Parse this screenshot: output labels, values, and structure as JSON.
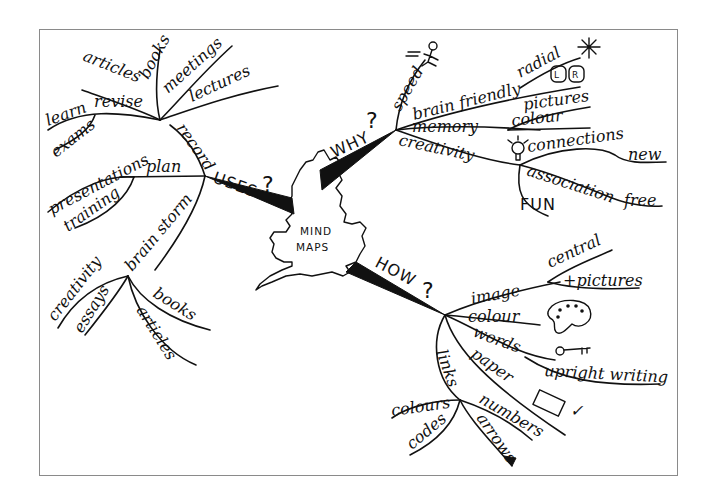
{
  "diagram": {
    "type": "mind-map",
    "center": {
      "line1": "MIND",
      "line2": "MAPS",
      "shape": "great-britain-outline"
    },
    "branches": {
      "uses": {
        "label": "USES",
        "marker": "?",
        "children": {
          "record": {
            "label": "record",
            "children": [
              "articles",
              "books",
              "meetings",
              "lectures"
            ]
          },
          "revise": {
            "label": "revise",
            "children": [
              "learn",
              "exams"
            ]
          },
          "plan": {
            "label": "plan",
            "children": [
              "presentations",
              "training"
            ]
          },
          "brain_storm": {
            "label": "brain storm",
            "children": [
              "creativity",
              "essays",
              "books",
              "articles"
            ]
          }
        }
      },
      "why": {
        "label": "WHY",
        "marker": "?",
        "children": {
          "speed": {
            "label": "speed",
            "icon": "running-figure-icon"
          },
          "brain_friendly": {
            "label": "brain friendly",
            "children": [
              "radial",
              "L R"
            ]
          },
          "memory": {
            "label": "memory",
            "children": [
              "pictures",
              "colour"
            ]
          },
          "creativity": {
            "label": "creativity",
            "icon": "lightbulb-icon",
            "children": [
              "connections",
              "new",
              "association",
              "free",
              "FUN"
            ]
          }
        }
      },
      "how": {
        "label": "HOW",
        "marker": "?",
        "children": {
          "image": {
            "label": "image",
            "children": [
              "central",
              "+pictures"
            ]
          },
          "colour": {
            "label": "colour",
            "icon": "palette-icon"
          },
          "words": {
            "label": "words",
            "icon": "key-icon",
            "children": [
              "upright writing"
            ]
          },
          "paper": {
            "label": "paper",
            "icon": "landscape-paper-icon",
            "mark": "✓"
          },
          "links": {
            "label": "links",
            "children": [
              "colours",
              "codes",
              "numbers",
              "arrows"
            ]
          }
        }
      }
    }
  },
  "t": {
    "uses": "USES",
    "q": "?",
    "record": "record",
    "articles": "articles",
    "books": "books",
    "meetings": "meetings",
    "lectures": "lectures",
    "revise": "revise",
    "learn": "learn",
    "exams": "exams",
    "plan": "plan",
    "presentations": "presentations",
    "training": "training",
    "brain_storm": "brain storm",
    "creativity": "creativity",
    "essays": "essays",
    "bs_books": "books",
    "bs_articles": "articles",
    "why": "WHY",
    "speed": "speed",
    "brain_friendly": "brain friendly",
    "radial": "radial",
    "L": "L",
    "R": "R",
    "memory": "memory",
    "pictures": "pictures",
    "colour_w": "colour",
    "creativity_w": "creativity",
    "connections": "connections",
    "new": "new",
    "association": "association",
    "free": "free",
    "fun": "FUN",
    "how": "HOW",
    "image": "image",
    "central": "central",
    "plus_pictures": "+pictures",
    "colour": "colour",
    "words": "words",
    "upright_writing": "upright writing",
    "paper": "paper",
    "links": "links",
    "colours": "colours",
    "codes": "codes",
    "numbers": "numbers",
    "arrows": "arrows",
    "check": "✓",
    "mind": "MIND",
    "maps": "MAPS"
  }
}
